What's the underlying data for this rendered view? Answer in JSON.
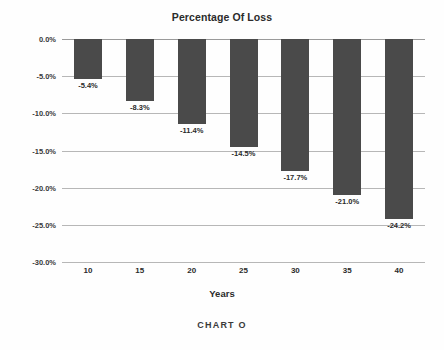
{
  "caption": "CHART O",
  "colors": {
    "bar": "#4a4a4a",
    "gridline": "#b7b7b7",
    "axis": "#9a9a9a",
    "text": "#2b2b2b",
    "background": "#fefefe"
  },
  "chart_data": {
    "type": "bar",
    "title": "Percentage Of Loss",
    "xlabel": "Years",
    "ylabel": "",
    "categories": [
      "10",
      "15",
      "20",
      "25",
      "30",
      "35",
      "40"
    ],
    "values": [
      -5.4,
      -8.3,
      -11.4,
      -14.5,
      -17.7,
      -21.0,
      -24.2
    ],
    "data_labels": [
      "-5.4%",
      "-8.3%",
      "-11.4%",
      "-14.5%",
      "-17.7%",
      "-21.0%",
      "-24.2%"
    ],
    "ylim": [
      -30.0,
      0.0
    ],
    "ytick_values": [
      0.0,
      -5.0,
      -10.0,
      -15.0,
      -20.0,
      -25.0,
      -30.0
    ],
    "ytick_labels": [
      "0.0%",
      "-5.0%",
      "-10.0%",
      "-15.0%",
      "-20.0%",
      "-25.0%",
      "-30.0%"
    ],
    "grid": true,
    "legend": false,
    "legend_position": "none",
    "series": [
      {
        "name": "Percentage Of Loss",
        "values": [
          -5.4,
          -8.3,
          -11.4,
          -14.5,
          -17.7,
          -21.0,
          -24.2
        ]
      }
    ]
  }
}
